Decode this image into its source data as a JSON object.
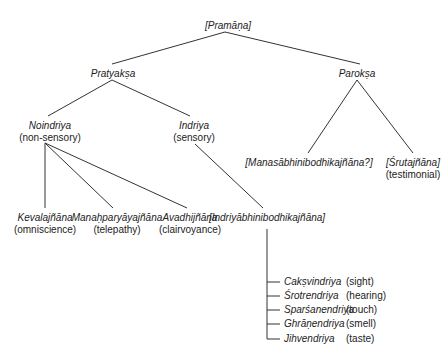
{
  "diagram": {
    "root": {
      "term": "[Pramāṇa]"
    },
    "pratyaksa": {
      "term": "Pratyakṣa"
    },
    "paroksa": {
      "term": "Parokṣa"
    },
    "noindriya": {
      "term": "Noindriya",
      "gloss": "(non-sensory)"
    },
    "indriya": {
      "term": "Indriya",
      "gloss": "(sensory)"
    },
    "manasa": {
      "term": "[Manasābhinibodhikajñāna?]"
    },
    "sruta": {
      "term": "[Śrutajñāna]",
      "gloss": "(testimonial)"
    },
    "kevala": {
      "term": "Kevalajñāna",
      "gloss": "(omniscience)"
    },
    "manahparyaya": {
      "term": "Manaḥparyāyajñāna",
      "gloss": "(telepathy)"
    },
    "avadhi": {
      "term": "Avadhijñāna",
      "gloss": "(clairvoyance)"
    },
    "indriyabhini": {
      "term": "[Indriyābhinibodhikajñāna]"
    },
    "senses": [
      {
        "term": "Cakṣvindriya",
        "gloss": "(sight)"
      },
      {
        "term": "Śrotrendriya",
        "gloss": "(hearing)"
      },
      {
        "term": "Sparśanendriya",
        "gloss": "(touch)"
      },
      {
        "term": "Ghrāṇendriya",
        "gloss": "(smell)"
      },
      {
        "term": "Jihvendriya",
        "gloss": "(taste)"
      }
    ]
  }
}
